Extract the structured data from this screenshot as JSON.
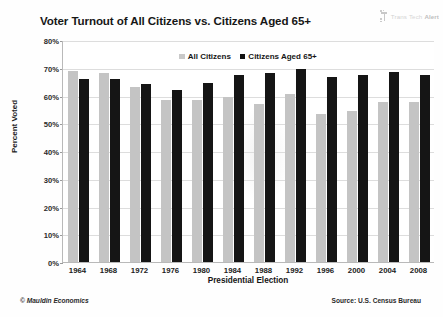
{
  "title": "Voter Turnout of All Citizens vs. Citizens Aged 65+",
  "brand": {
    "mark_name": "transtech-logo-mark",
    "word1": "Trans",
    "word2": "Tech",
    "word3": "Alert"
  },
  "footer": {
    "left": "© Mauldin Economics",
    "right": "Source: U.S. Census Bureau"
  },
  "chart_data": {
    "type": "bar",
    "title": "Voter Turnout of All Citizens vs. Citizens Aged 65+",
    "xlabel": "Presidential Election",
    "ylabel": "Percent Voted",
    "ylim": [
      0,
      80
    ],
    "ytick_labels": [
      "0%",
      "10%",
      "20%",
      "30%",
      "40%",
      "50%",
      "60%",
      "70%",
      "80%"
    ],
    "ytick_values": [
      0,
      10,
      20,
      30,
      40,
      50,
      60,
      70,
      80
    ],
    "grid": true,
    "legend_position": "top-center",
    "categories": [
      "1964",
      "1968",
      "1972",
      "1976",
      "1980",
      "1984",
      "1988",
      "1992",
      "1996",
      "2000",
      "2004",
      "2008"
    ],
    "series": [
      {
        "name": "All Citizens",
        "color": "#c4c4c4",
        "values": [
          69.0,
          68.0,
          63.0,
          58.5,
          58.5,
          59.5,
          57.0,
          60.5,
          53.5,
          54.5,
          57.5,
          57.5
        ]
      },
      {
        "name": "Citizens Aged 65+",
        "color": "#151515",
        "values": [
          66.0,
          66.0,
          64.0,
          62.0,
          64.5,
          67.5,
          68.0,
          69.5,
          66.5,
          67.5,
          68.5,
          67.5
        ]
      }
    ]
  }
}
